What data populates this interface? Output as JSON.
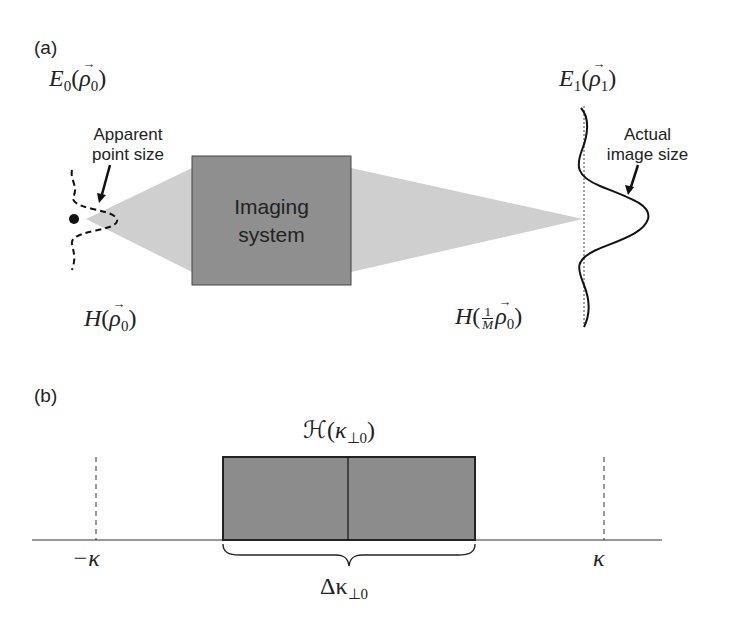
{
  "panel_a": {
    "label": "(a)",
    "source_field": {
      "symbol": "E",
      "sub": "0",
      "arg": "ρ",
      "arg_sub": "0"
    },
    "image_field": {
      "symbol": "E",
      "sub": "1",
      "arg": "ρ",
      "arg_sub": "1"
    },
    "apparent_annotation": {
      "line1": "Apparent",
      "line2": "point size"
    },
    "actual_annotation": {
      "line1": "Actual",
      "line2": "image size"
    },
    "box": {
      "line1": "Imaging",
      "line2": "system"
    },
    "source_psf": {
      "symbol": "H",
      "arg": "ρ",
      "arg_sub": "0"
    },
    "image_psf": {
      "symbol": "H",
      "frac_num": "1",
      "frac_den": "M",
      "arg": "ρ",
      "arg_sub": "0"
    }
  },
  "panel_b": {
    "label": "(b)",
    "transfer_function": {
      "symbol": "ℋ",
      "arg": "κ",
      "arg_sub": "⊥0"
    },
    "left_tick": "−κ",
    "right_tick": "κ",
    "bandwidth": {
      "symbol": "Δκ",
      "sub": "⊥0"
    }
  },
  "colors": {
    "box_fill": "#8f8f8f",
    "cone_fill": "#cfcfcf",
    "rect_fill": "#8c8c8c",
    "line": "#222222"
  }
}
